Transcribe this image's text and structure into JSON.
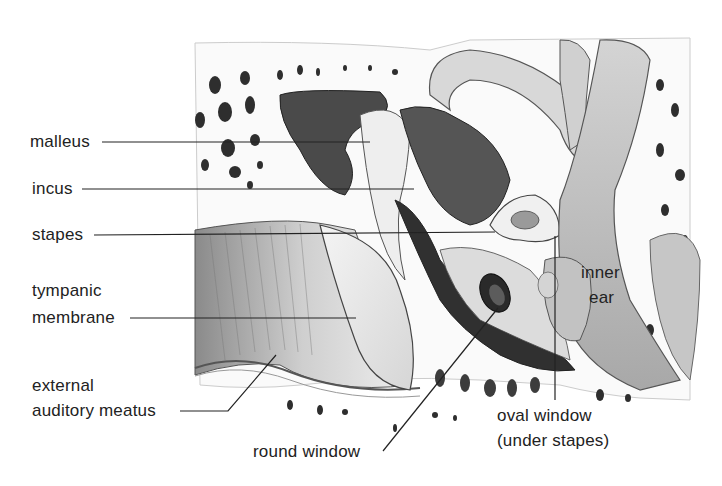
{
  "diagram": {
    "colors": {
      "ink": "#222222",
      "bone_light": "#e8e8e8",
      "bone_mid": "#bdbdbd",
      "tissue_dark": "#3a3a3a",
      "canal_shade": "#9a9a9a",
      "background": "#ffffff"
    },
    "labels": {
      "malleus": "malleus",
      "incus": "incus",
      "stapes": "stapes",
      "tympanic_line1": "tympanic",
      "tympanic_line2": "membrane",
      "external_line1": "external",
      "external_line2": "auditory meatus",
      "round_window": "round window",
      "oval_line1": "oval window",
      "oval_line2": "(under stapes)",
      "inner_line1": "inner",
      "inner_line2": "ear"
    }
  }
}
